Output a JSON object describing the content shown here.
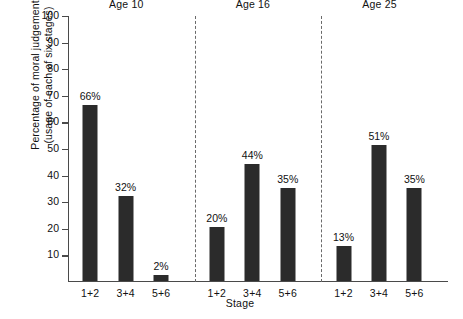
{
  "chart_data": {
    "type": "bar",
    "title": "",
    "subtitle": "",
    "xlabel": "Stage",
    "ylabel_line1": "Percentage of moral judgement",
    "ylabel_line2": "(usage of each of six stages)",
    "ylim": [
      0,
      100
    ],
    "yticks": [
      100,
      90,
      80,
      70,
      60,
      50,
      40,
      30,
      20,
      10
    ],
    "grid": false,
    "legend": "none",
    "categories": [
      "1+2",
      "3+4",
      "5+6"
    ],
    "groups": [
      {
        "label": "Age 10",
        "bars": [
          {
            "category": "1+2",
            "value": 66,
            "value_label": "66%"
          },
          {
            "category": "3+4",
            "value": 32,
            "value_label": "32%"
          },
          {
            "category": "5+6",
            "value": 2,
            "value_label": "2%"
          }
        ]
      },
      {
        "label": "Age 16",
        "bars": [
          {
            "category": "1+2",
            "value": 20,
            "value_label": "20%"
          },
          {
            "category": "3+4",
            "value": 44,
            "value_label": "44%"
          },
          {
            "category": "5+6",
            "value": 35,
            "value_label": "35%"
          }
        ]
      },
      {
        "label": "Age 25",
        "bars": [
          {
            "category": "1+2",
            "value": 13,
            "value_label": "13%"
          },
          {
            "category": "3+4",
            "value": 51,
            "value_label": "51%"
          },
          {
            "category": "5+6",
            "value": 35,
            "value_label": "35%"
          }
        ]
      }
    ],
    "series": [
      {
        "name": "Age 10",
        "values": [
          66,
          32,
          2
        ]
      },
      {
        "name": "Age 16",
        "values": [
          20,
          44,
          35
        ]
      },
      {
        "name": "Age 25",
        "values": [
          13,
          51,
          35
        ]
      }
    ],
    "colors": {
      "bar": "#2b2b2b",
      "axis": "#4a4a4a",
      "separator": "#6a6a6a",
      "text": "#111111",
      "background": "#ffffff"
    }
  }
}
